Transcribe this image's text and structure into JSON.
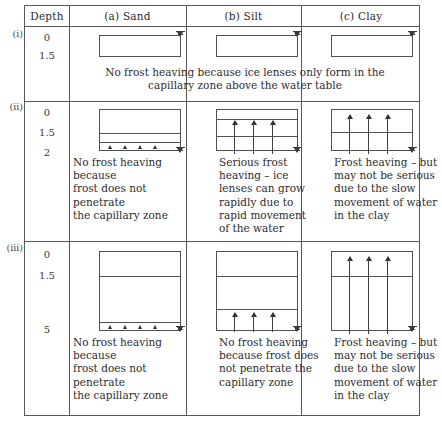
{
  "figure": {
    "type": "diagram-table",
    "columns": [
      {
        "key": "depth",
        "label": "Depth"
      },
      {
        "key": "sand",
        "label": "(a)  Sand"
      },
      {
        "key": "silt",
        "label": "(b)  Silt"
      },
      {
        "key": "clay",
        "label": "(c)  Clay"
      }
    ],
    "rows": [
      {
        "id": "i",
        "roman_label": "(i)",
        "depth_labels": [
          "0",
          "1.5"
        ],
        "shared_note": "No frost heaving because ice lenses only form in the\ncapillary zone above the water table",
        "cells": [
          {
            "column": "sand",
            "note": ""
          },
          {
            "column": "silt",
            "note": ""
          },
          {
            "column": "clay",
            "note": ""
          }
        ]
      },
      {
        "id": "ii",
        "roman_label": "(ii)",
        "depth_labels": [
          "0",
          "1.5",
          "2"
        ],
        "shared_note": "",
        "cells": [
          {
            "column": "sand",
            "note": "No frost heaving because\nfrost does not penetrate\nthe capillary zone"
          },
          {
            "column": "silt",
            "note": "Serious frost\nheaving – ice\nlenses can grow\nrapidly due to\nrapid movement\nof the water"
          },
          {
            "column": "clay",
            "note": "Frost heaving – but\nmay not be serious\ndue to the slow\nmovement of water\nin the clay"
          }
        ]
      },
      {
        "id": "iii",
        "roman_label": "(iii)",
        "depth_labels": [
          "0",
          "1.5",
          "5"
        ],
        "shared_note": "",
        "cells": [
          {
            "column": "sand",
            "note": "No frost heaving because\nfrost does not penetrate\nthe capillary zone"
          },
          {
            "column": "silt",
            "note": "No frost heaving\nbecause frost does\nnot penetrate the\ncapillary zone"
          },
          {
            "column": "clay",
            "note": "Frost heaving – but\nmay not be serious\ndue to the slow\nmovement of water\nin the clay"
          }
        ]
      }
    ],
    "symbols": {
      "water_table": "water-table-symbol",
      "upward_arrow": "upward-arrow-icon",
      "capillary_tick": "capillary-tick-icon"
    },
    "colors": {
      "rule": "#585858",
      "profile_outline": "#4f4f4f",
      "ink": "#2d2d2d",
      "background": "#ffffff"
    }
  }
}
